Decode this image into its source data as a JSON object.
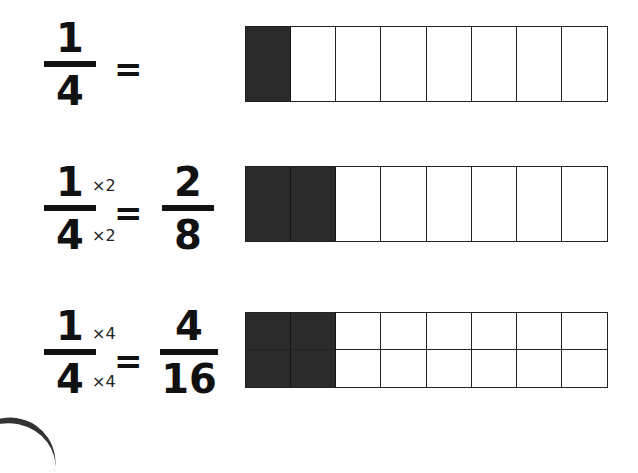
{
  "rows": [
    {
      "left": {
        "numerator": "1",
        "denominator": "4"
      },
      "equals": "=",
      "model": {
        "rows": 1,
        "cols": 8,
        "shaded": 1
      }
    },
    {
      "left": {
        "numerator": "1",
        "denominator": "4"
      },
      "multiplier_top": "×2",
      "multiplier_bottom": "×2",
      "equals": "=",
      "right": {
        "numerator": "2",
        "denominator": "8"
      },
      "model": {
        "rows": 1,
        "cols": 8,
        "shaded": 2
      }
    },
    {
      "left": {
        "numerator": "1",
        "denominator": "4"
      },
      "multiplier_top": "×4",
      "multiplier_bottom": "×4",
      "equals": "=",
      "right": {
        "numerator": "4",
        "denominator": "16"
      },
      "model": {
        "rows": 2,
        "cols": 8,
        "shaded_cols": 2
      }
    }
  ],
  "colors": {
    "shaded": "#2b2b2b",
    "line": "#222222",
    "background": "#ffffff"
  }
}
